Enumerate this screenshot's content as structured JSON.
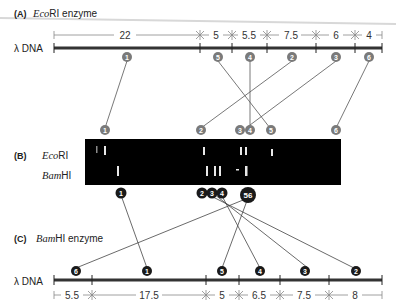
{
  "panelA": {
    "label": "(A)",
    "enzyme_italic": "Eco",
    "enzyme_roman": "RI enzyme",
    "dna_label": "λ DNA",
    "segments": [
      "22",
      "5",
      "5.5",
      "7.5",
      "6",
      "4"
    ],
    "fragment_markers": [
      "1",
      "5",
      "4",
      "2",
      "3",
      "6"
    ],
    "gel_markers": [
      "1",
      "2",
      "3",
      "4",
      "5",
      "6"
    ],
    "marker_color": "#7a7a7a"
  },
  "panelB": {
    "label": "(B)",
    "lane1_italic": "Eco",
    "lane1_roman": "RI",
    "lane2_italic": "Bam",
    "lane2_roman": "HI",
    "gel_markers": [
      "1",
      "2",
      "3",
      "4",
      "56"
    ],
    "gel_color": "#000000"
  },
  "panelC": {
    "label": "(C)",
    "enzyme_italic": "Bam",
    "enzyme_roman": "HI enzyme",
    "dna_label": "λ DNA",
    "segments": [
      "5.5",
      "17.5",
      "5",
      "6.5",
      "7.5",
      "8"
    ],
    "fragment_markers": [
      "6",
      "1",
      "5",
      "4",
      "3",
      "2"
    ],
    "marker_color": "#1a1a1a"
  }
}
